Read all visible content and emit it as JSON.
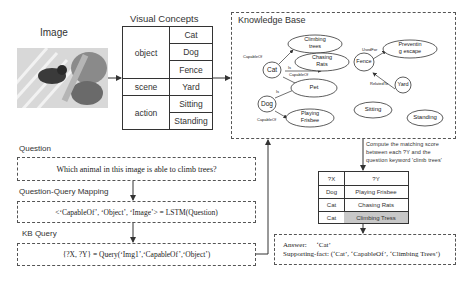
{
  "image_section": {
    "title": "Image",
    "image_description": "grayscale photo of a cat and dog near a fence"
  },
  "visual_concepts": {
    "title": "Visual Concepts",
    "groups": [
      {
        "category": "object",
        "items": [
          "Cat",
          "Dog",
          "Fence"
        ]
      },
      {
        "category": "scene",
        "items": [
          "Yard"
        ]
      },
      {
        "category": "action",
        "items": [
          "Sitting",
          "Standing"
        ]
      }
    ]
  },
  "knowledge_base": {
    "title": "Knowledge Base",
    "nodes": {
      "cat": "Cat",
      "dog": "Dog",
      "climbing_trees_1": "Climbing",
      "climbing_trees_2": "trees",
      "chasing_rats_1": "Chasing",
      "chasing_rats_2": "Rats",
      "pet": "Pet",
      "playing_frisbee_1": "Playing",
      "playing_frisbee_2": "Frisbee",
      "fence": "Fence",
      "preventing_escape_1": "Preventin",
      "preventing_escape_2": "g escape",
      "yard": "Yard",
      "sitting": "Sitting",
      "standing": "Standing"
    },
    "edges": {
      "cat_climbing": "CapableOf",
      "cat_chasing": "CapableOf",
      "cat_pet": "Is",
      "dog_pet": "Is",
      "dog_frisbee": "CapableOf",
      "fence_preventing": "UsedFor",
      "yard_fence": "RelatedTo"
    }
  },
  "matching_note": {
    "line1": "Compute the matching score",
    "line2": "between each ?Y and the",
    "line3": "question keyword 'climb trees'"
  },
  "result_table": {
    "headers": [
      "?X",
      "?Y"
    ],
    "rows": [
      {
        "x": "Dog",
        "y": "Playing Frisbee",
        "highlight": false
      },
      {
        "x": "Cat",
        "y": "Chasing Rats",
        "highlight": false
      },
      {
        "x": "Cat",
        "y": "Climbing Tress",
        "highlight": true
      }
    ]
  },
  "question_section": {
    "title": "Question",
    "text": "Which animal in this image is able to climb trees?"
  },
  "mapping_section": {
    "title": "Question-Query Mapping",
    "text": "<‘CapableOf’, ‘Object’, ‘Image’> = LSTM(Question)"
  },
  "kb_query_section": {
    "title": "KB Query",
    "text": "{?X, ?Y} = Query(‘Img1’,‘CapableOf’,‘Object’)"
  },
  "answer_section": {
    "answer_label": "Answer:",
    "answer_value": "‘Cat’",
    "fact_label": "Supporting-fact:",
    "fact_value": "(‘Cat’, ‘CapableOf’, ‘Climbing Trees’)"
  },
  "colors": {
    "line": "#333333",
    "dashed_border": "#555555",
    "highlight_cell": "#c8c8c8"
  }
}
